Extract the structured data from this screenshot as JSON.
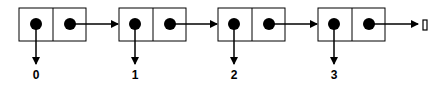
{
  "diagram": {
    "type": "linked-list",
    "nodes": [
      {
        "car": "0",
        "x": 19
      },
      {
        "car": "1",
        "x": 119
      },
      {
        "car": "2",
        "x": 218
      },
      {
        "car": "3",
        "x": 318
      }
    ],
    "terminator": "[]",
    "colors": {
      "stroke": "#000000",
      "fill": "#000000",
      "background": "#ffffff"
    }
  }
}
